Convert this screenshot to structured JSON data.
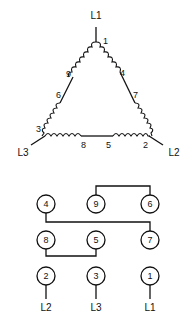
{
  "delta": {
    "lines": {
      "top": "L1",
      "left": "L3",
      "right": "L2"
    },
    "terminals": {
      "t1": "1",
      "t4": "4",
      "t7": "7",
      "t9": "9",
      "t6": "6",
      "t3": "3",
      "t8": "8",
      "t5": "5",
      "t2": "2"
    }
  },
  "terminal_board": {
    "rows": [
      [
        "4",
        "9",
        "6"
      ],
      [
        "8",
        "5",
        "7"
      ],
      [
        "2",
        "3",
        "1"
      ]
    ],
    "connections": [
      [
        "9",
        "6"
      ],
      [
        "4",
        "7"
      ],
      [
        "8",
        "5"
      ]
    ],
    "leads": [
      "L2",
      "L3",
      "L1"
    ]
  }
}
